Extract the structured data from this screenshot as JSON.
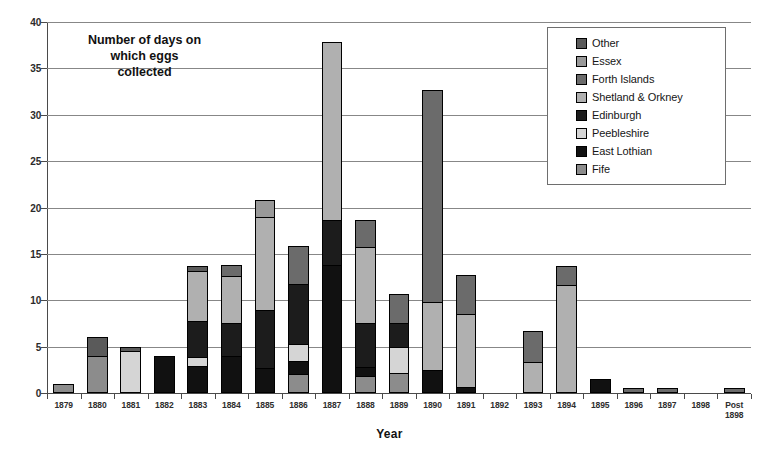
{
  "chart_data": {
    "type": "bar",
    "subtype": "stacked-bar",
    "xlabel": "Year",
    "ylabel": "",
    "ylim": [
      0,
      40
    ],
    "ytick_step": 5,
    "yticks": [
      "0",
      "5",
      "10",
      "15",
      "20",
      "25",
      "30",
      "35",
      "40"
    ],
    "grid": true,
    "legend_position": "top-right",
    "categories": [
      "1879",
      "1880",
      "1881",
      "1882",
      "1883",
      "1884",
      "1885",
      "1886",
      "1887",
      "1888",
      "1889",
      "1890",
      "1891",
      "1892",
      "1893",
      "1894",
      "1895",
      "1896",
      "1897",
      "1898",
      "Post\n1898"
    ],
    "series": [
      {
        "name": "Fife",
        "color": "#8c8c8c",
        "values": [
          1.0,
          4.0,
          0.0,
          0.0,
          0.0,
          0.0,
          0.0,
          2.0,
          0.0,
          1.8,
          2.2,
          0.0,
          0.0,
          0,
          0.0,
          0.0,
          0.0,
          0.0,
          0.0,
          0,
          0.0
        ]
      },
      {
        "name": "East Lothian",
        "color": "#111111",
        "values": [
          0.0,
          0.0,
          0.0,
          4.0,
          2.9,
          4.0,
          2.7,
          1.5,
          13.8,
          1.0,
          0.0,
          2.5,
          0.7,
          0,
          0.0,
          0.0,
          1.5,
          0.0,
          0.0,
          0,
          0.0
        ]
      },
      {
        "name": "Peebleshire",
        "color": "#d5d5d5",
        "values": [
          0.0,
          0.0,
          4.5,
          0.0,
          1.0,
          0.0,
          0.0,
          1.8,
          0.0,
          0.0,
          2.8,
          0.0,
          0.0,
          0,
          0.0,
          0.0,
          0.0,
          0.0,
          0.0,
          0,
          0.0
        ]
      },
      {
        "name": "Edinburgh",
        "color": "#1c1c1c",
        "values": [
          0.0,
          0.0,
          0.0,
          0.0,
          3.9,
          3.6,
          6.3,
          6.5,
          4.9,
          4.7,
          2.6,
          0.0,
          0.0,
          0,
          0.0,
          0.0,
          0.0,
          0.0,
          0.0,
          0,
          0.0
        ]
      },
      {
        "name": "Shetland & Orkney",
        "color": "#b0b0b0",
        "values": [
          0.0,
          0.0,
          0.0,
          0.0,
          5.4,
          5.0,
          10.0,
          0.0,
          19.1,
          8.2,
          0.0,
          7.3,
          7.8,
          0,
          3.3,
          11.6,
          0.0,
          0.0,
          0.0,
          0,
          0.0
        ]
      },
      {
        "name": "Forth Islands",
        "color": "#6b6b6b",
        "values": [
          0.0,
          0.0,
          0.0,
          0.0,
          0.0,
          1.2,
          0.0,
          4.0,
          0.0,
          3.0,
          3.1,
          22.9,
          4.2,
          0,
          3.4,
          2.1,
          0.0,
          0.5,
          0.5,
          0,
          0.5
        ]
      },
      {
        "name": "Essex",
        "color": "#999999",
        "values": [
          0.0,
          0.0,
          0.0,
          0.0,
          0.0,
          0.0,
          1.8,
          0.0,
          0.0,
          0.0,
          0.0,
          0.0,
          0.0,
          0,
          0.0,
          0.0,
          0.0,
          0.0,
          0.0,
          0,
          0.0
        ]
      },
      {
        "name": "Other",
        "color": "#5a5a5a",
        "values": [
          0.0,
          2.0,
          0.5,
          0.0,
          0.5,
          0.0,
          0.0,
          0.0,
          0.0,
          0.0,
          0.0,
          0.0,
          0.0,
          0,
          0.0,
          0.0,
          0.0,
          0.0,
          0.0,
          0,
          0.0
        ]
      }
    ],
    "totals": [
      1.0,
      6.0,
      5.0,
      4.0,
      13.7,
      13.8,
      20.8,
      15.8,
      37.8,
      18.7,
      10.7,
      32.7,
      12.7,
      0,
      6.7,
      13.7,
      1.5,
      0.5,
      0.5,
      0,
      0.5
    ]
  },
  "legend": {
    "items": [
      {
        "label": "Other",
        "color": "#5a5a5a"
      },
      {
        "label": "Essex",
        "color": "#999999"
      },
      {
        "label": "Forth Islands",
        "color": "#6b6b6b"
      },
      {
        "label": "Shetland & Orkney",
        "color": "#b0b0b0"
      },
      {
        "label": "Edinburgh",
        "color": "#1c1c1c"
      },
      {
        "label": "Peebleshire",
        "color": "#d5d5d5"
      },
      {
        "label": "East Lothian",
        "color": "#111111"
      },
      {
        "label": "Fife",
        "color": "#8c8c8c"
      }
    ]
  }
}
